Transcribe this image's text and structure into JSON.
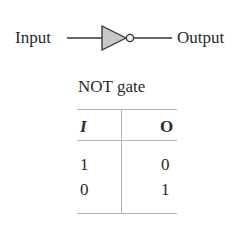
{
  "diagram": {
    "input_label": "Input",
    "output_label": "Output",
    "gate_symbol": "not-gate-icon",
    "gate_fill": "#c8c8c8",
    "stroke": "#333333"
  },
  "truth_table": {
    "title": "NOT gate",
    "headers": [
      "I",
      "O"
    ],
    "rows": [
      [
        "1",
        "0"
      ],
      [
        "0",
        "1"
      ]
    ]
  }
}
